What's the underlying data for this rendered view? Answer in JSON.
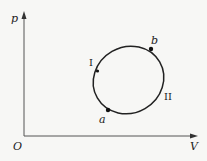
{
  "diagram": {
    "type": "p-V cycle diagram",
    "axes": {
      "y_label": "p",
      "x_label": "V",
      "origin_label": "O"
    },
    "cycle": {
      "shape": "ellipse (closed loop)",
      "points": [
        {
          "label": "a"
        },
        {
          "label": "b"
        }
      ],
      "paths": [
        {
          "label": "I"
        },
        {
          "label": "II"
        }
      ]
    },
    "colors": {
      "background": "#f7f7f5",
      "stroke": "#222222"
    }
  }
}
